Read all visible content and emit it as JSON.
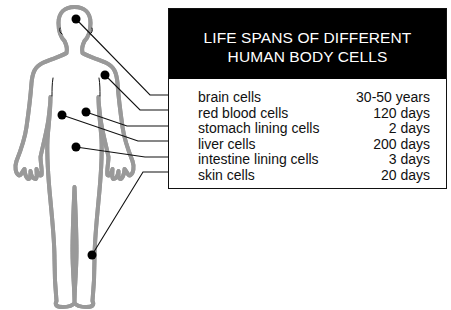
{
  "title": {
    "line1": "LIFE SPANS OF DIFFERENT",
    "line2": "HUMAN BODY CELLS"
  },
  "cells": [
    {
      "label": "brain cells",
      "value": "30-50 years",
      "location": "head"
    },
    {
      "label": "red blood cells",
      "value": "120 days",
      "location": "chest"
    },
    {
      "label": "stomach lining cells",
      "value": "2 days",
      "location": "stomach"
    },
    {
      "label": "liver cells",
      "value": "200 days",
      "location": "liver"
    },
    {
      "label": "intestine lining cells",
      "value": "3 days",
      "location": "abdomen"
    },
    {
      "label": "skin cells",
      "value": "20 days",
      "location": "lower leg"
    }
  ],
  "colors": {
    "header_bg": "#000000",
    "header_text": "#ffffff",
    "text": "#111111",
    "lines": "#111111"
  }
}
